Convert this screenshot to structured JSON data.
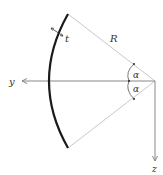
{
  "diagram": {
    "title": "",
    "labels": {
      "thickness": "t",
      "radius": "R",
      "angle_upper": "α",
      "angle_lower": "α",
      "y_axis": "y",
      "z_axis": "z"
    },
    "colors": {
      "shell": "#1a1a1a",
      "radius_line": "#c8c8c8",
      "axis": "#888888",
      "text": "#333333"
    }
  }
}
